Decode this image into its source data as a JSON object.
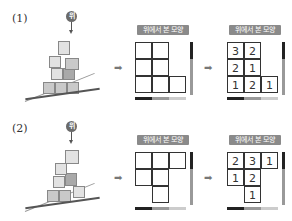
{
  "problems": [
    {
      "label": "(1)",
      "marker": "위",
      "view_title": "위에서 본 모양",
      "arrow": "➡",
      "empty_grid": [
        [
          1,
          1,
          0
        ],
        [
          1,
          1,
          0
        ],
        [
          1,
          1,
          1
        ]
      ],
      "answer_grid": [
        [
          "3",
          "2",
          ""
        ],
        [
          "2",
          "1",
          ""
        ],
        [
          "1",
          "2",
          "1"
        ]
      ]
    },
    {
      "label": "(2)",
      "marker": "위",
      "view_title": "위에서 본 모양",
      "arrow": "➡",
      "empty_grid": [
        [
          1,
          1,
          1
        ],
        [
          1,
          1,
          0
        ],
        [
          0,
          1,
          0
        ]
      ],
      "answer_grid": [
        [
          "2",
          "3",
          "1"
        ],
        [
          "1",
          "2",
          ""
        ],
        [
          "",
          "1",
          ""
        ]
      ]
    }
  ]
}
